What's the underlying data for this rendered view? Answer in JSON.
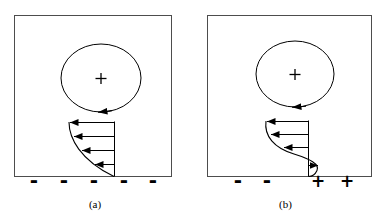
{
  "figure": {
    "type": "diagram",
    "background_color": "#ffffff",
    "line_color": "#000000",
    "panels": [
      {
        "id": "a",
        "caption": "(a)",
        "frame": {
          "x": 14,
          "y": 15,
          "width": 158,
          "height": 162
        },
        "vortex": {
          "center_x": 101,
          "center_y": 78,
          "radius_x": 40,
          "radius_y": 34,
          "center_marker": "+",
          "rotation_arrow": "left",
          "arrow_position": "bottom"
        },
        "velocity_profile": {
          "shape": "concave-attached",
          "baseline_y": 177,
          "axis_x": 114,
          "top_y": 122,
          "arrow_count": 4,
          "arrow_directions": [
            "left",
            "left",
            "left",
            "left"
          ],
          "arrow_rows_y": [
            122,
            136,
            150,
            164
          ]
        },
        "surface_charges": [
          {
            "sign": "-",
            "x": 33
          },
          {
            "sign": "-",
            "x": 63
          },
          {
            "sign": "-",
            "x": 93
          },
          {
            "sign": "-",
            "x": 123
          },
          {
            "sign": "-",
            "x": 152
          }
        ]
      },
      {
        "id": "b",
        "caption": "(b)",
        "frame": {
          "x": 17,
          "y": 15,
          "width": 165,
          "height": 162
        },
        "vortex": {
          "center_x": 105,
          "center_y": 74,
          "radius_x": 39,
          "radius_y": 33,
          "center_marker": "+",
          "rotation_arrow": "left",
          "arrow_position": "bottom"
        },
        "velocity_profile": {
          "shape": "s-curve-separated",
          "baseline_y": 177,
          "axis_x": 118,
          "top_y": 121,
          "arrow_count": 4,
          "arrow_directions": [
            "left",
            "left",
            "left",
            "right"
          ],
          "arrow_rows_y": [
            121,
            134,
            147,
            165
          ]
        },
        "surface_charges": [
          {
            "sign": "-",
            "x": 47
          },
          {
            "sign": "-",
            "x": 76
          },
          {
            "sign": "+",
            "x": 127
          },
          {
            "sign": "+",
            "x": 156
          }
        ]
      }
    ]
  }
}
